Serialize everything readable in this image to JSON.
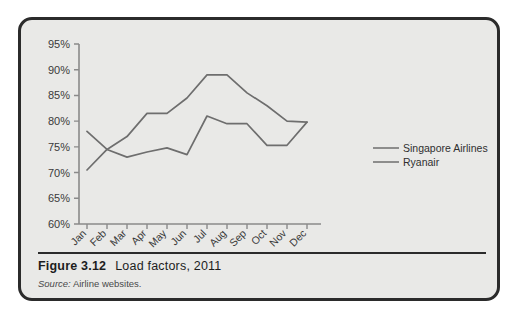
{
  "figure": {
    "number": "Figure 3.12",
    "title": "Load factors, 2011",
    "source_prefix": "Source:",
    "source_text": "Airline websites."
  },
  "colors": {
    "card_background": "#e9e9e7",
    "card_border": "#2b2b2b",
    "axis": "#8a8a8a",
    "series_line": "#6e6e6e",
    "page_background": "#ffffff"
  },
  "chart_data": {
    "type": "line",
    "title": "Load factors, 2011",
    "xlabel": "",
    "ylabel": "",
    "ylim": [
      60,
      95
    ],
    "yticks": [
      60,
      65,
      70,
      75,
      80,
      85,
      90,
      95
    ],
    "ytick_labels": [
      "60%",
      "65%",
      "70%",
      "75%",
      "80%",
      "85%",
      "90%",
      "95%"
    ],
    "grid": false,
    "legend_position": "right",
    "categories": [
      "Jan",
      "Feb",
      "Mar",
      "Apr",
      "May",
      "Jun",
      "Jul",
      "Aug",
      "Sep",
      "Oct",
      "Nov",
      "Dec"
    ],
    "series": [
      {
        "name": "Singapore Airlines",
        "values": [
          70.5,
          74.5,
          77.0,
          81.5,
          81.5,
          84.5,
          89.0,
          89.0,
          85.5,
          83.0,
          80.0,
          79.8
        ]
      },
      {
        "name": "Ryanair",
        "values": [
          78.0,
          74.5,
          73.0,
          74.0,
          74.8,
          73.5,
          81.0,
          79.5,
          79.5,
          75.3,
          75.3,
          79.8
        ]
      }
    ]
  }
}
